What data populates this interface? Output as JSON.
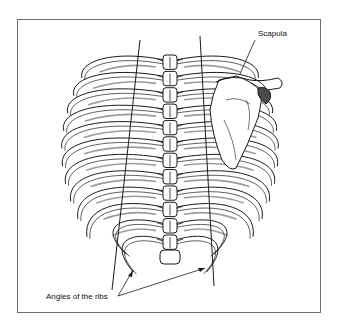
{
  "figure": {
    "labels": {
      "scapula": "Scapula",
      "angles_of_ribs": "Angles of the ribs"
    },
    "rib_pairs": 12,
    "colors": {
      "ink": "#1a1a1a",
      "frame": "#6e6e6e",
      "shade": "#4a4a4a",
      "background": "#ffffff"
    }
  }
}
